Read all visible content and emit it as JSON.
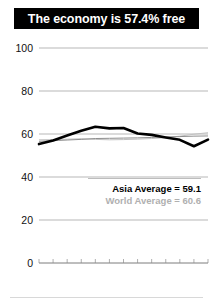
{
  "title": {
    "text": "The economy is 57.4% free",
    "banner_color": "#000000",
    "text_color": "#ffffff"
  },
  "legend": {
    "asia_label": "Asia Average = 59.1",
    "world_label": "World Average = 60.6",
    "asia_color": "#000000",
    "world_color": "#b0b0b0"
  },
  "axis": {
    "y_ticks": [
      "0",
      "20",
      "40",
      "60",
      "80",
      "100"
    ],
    "x_start_label": "1995",
    "x_end_label": "2007"
  },
  "chart_data": {
    "type": "line",
    "title": "The economy is 57.4% free",
    "xlabel": "",
    "ylabel": "",
    "xlim": [
      1995,
      2007
    ],
    "ylim": [
      0,
      100
    ],
    "grid": true,
    "legend_position": "inside-right",
    "x": [
      1995,
      1996,
      1997,
      1998,
      1999,
      2000,
      2001,
      2002,
      2003,
      2004,
      2005,
      2006,
      2007
    ],
    "series": [
      {
        "name": "Country",
        "color": "#000000",
        "emphasis": "bold",
        "values": [
          55.3,
          57.0,
          59.3,
          61.5,
          63.4,
          62.6,
          62.8,
          60.2,
          59.6,
          58.4,
          57.3,
          54.3,
          57.4
        ]
      },
      {
        "name": "Asia Average",
        "color": "#8f8f8f",
        "emphasis": "normal",
        "average": 59.1,
        "values": [
          56.6,
          56.9,
          57.2,
          57.5,
          57.9,
          58.0,
          58.1,
          58.2,
          58.4,
          58.6,
          58.8,
          59.0,
          59.1
        ]
      },
      {
        "name": "World Average",
        "color": "#c2c2c2",
        "emphasis": "normal",
        "average": 60.6,
        "values": [
          57.3,
          57.4,
          57.6,
          57.8,
          57.5,
          57.3,
          57.4,
          57.6,
          57.9,
          58.3,
          59.0,
          59.9,
          60.6
        ]
      }
    ],
    "annotations": [
      {
        "label": "Asia Average = 59.1",
        "value": 59.1
      },
      {
        "label": "World Average = 60.6",
        "value": 60.6
      }
    ]
  }
}
